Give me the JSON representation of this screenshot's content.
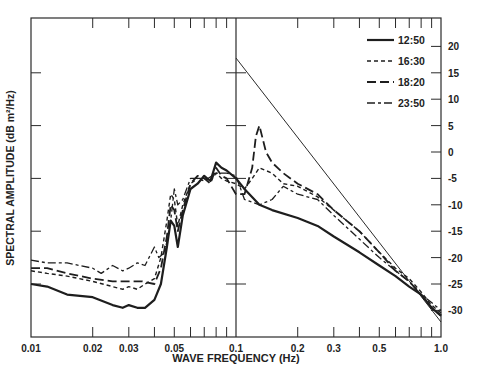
{
  "chart_data": {
    "type": "line",
    "title": "",
    "xlabel": "WAVE FREQUENCY (Hz)",
    "ylabel": "SPECTRAL AMPLITUDE (dB m²/Hz)",
    "xscale": "log",
    "xlim": [
      0.01,
      1.0
    ],
    "ylim": [
      -37,
      25
    ],
    "x_tick_labels": [
      "0.01",
      "0.02",
      "0.03",
      "0.05",
      "0.1",
      "0.2",
      "0.3",
      "0.5",
      "1.0"
    ],
    "x_ticks": [
      0.01,
      0.02,
      0.03,
      0.05,
      0.1,
      0.2,
      0.3,
      0.5,
      1.0
    ],
    "y_tick_labels": [
      "20",
      "15",
      "10",
      "5",
      "0",
      "-5",
      "-10",
      "-15",
      "-20",
      "-25",
      "-30"
    ],
    "y_ticks": [
      20,
      15,
      10,
      5,
      0,
      -5,
      -10,
      -15,
      -20,
      -25,
      -30
    ],
    "y_axis_side": "right",
    "grid": false,
    "legend_position": "upper right",
    "legend": [
      {
        "label": "12:50",
        "style": "solid"
      },
      {
        "label": "16:30",
        "style": "short-dash"
      },
      {
        "label": "18:20",
        "style": "long-dash"
      },
      {
        "label": "23:50",
        "style": "dash-dot"
      }
    ],
    "reference_line": {
      "style": "thin solid",
      "points": [
        [
          0.1,
          17.8
        ],
        [
          1.0,
          -32.2
        ]
      ]
    },
    "series": [
      {
        "name": "12:50",
        "style": "solid",
        "x": [
          0.01,
          0.012,
          0.015,
          0.02,
          0.025,
          0.028,
          0.03,
          0.033,
          0.036,
          0.04,
          0.043,
          0.046,
          0.048,
          0.05,
          0.052,
          0.055,
          0.06,
          0.065,
          0.07,
          0.075,
          0.08,
          0.085,
          0.09,
          0.1,
          0.11,
          0.13,
          0.15,
          0.2,
          0.25,
          0.3,
          0.4,
          0.5,
          0.6,
          0.7,
          0.8,
          0.9,
          1.0
        ],
        "y": [
          -25,
          -25.5,
          -27,
          -27.5,
          -29,
          -29.5,
          -29,
          -29.5,
          -29.5,
          -28,
          -25,
          -18,
          -13,
          -14,
          -18,
          -12,
          -7,
          -6,
          -4.5,
          -5.5,
          -2,
          -3,
          -3.5,
          -5,
          -7,
          -10,
          -11,
          -12.5,
          -14,
          -16,
          -19,
          -21.5,
          -23.5,
          -25.5,
          -27,
          -29.5,
          -31
        ]
      },
      {
        "name": "16:30",
        "style": "short-dash",
        "x": [
          0.01,
          0.012,
          0.015,
          0.02,
          0.025,
          0.028,
          0.03,
          0.033,
          0.036,
          0.04,
          0.043,
          0.046,
          0.048,
          0.05,
          0.052,
          0.055,
          0.06,
          0.065,
          0.07,
          0.075,
          0.08,
          0.085,
          0.09,
          0.1,
          0.11,
          0.12,
          0.13,
          0.15,
          0.17,
          0.2,
          0.25,
          0.3,
          0.4,
          0.5,
          0.6,
          0.7,
          0.8,
          0.9,
          1.0
        ],
        "y": [
          -22.5,
          -23,
          -23.5,
          -24.5,
          -25.5,
          -26,
          -25.5,
          -26,
          -25,
          -24,
          -20,
          -13,
          -8,
          -9,
          -14,
          -10,
          -6,
          -5,
          -5,
          -5.5,
          -4,
          -5,
          -5.5,
          -6,
          -7,
          -5,
          -3,
          -4,
          -6,
          -6.5,
          -8.5,
          -11,
          -15,
          -19,
          -22,
          -24,
          -26.5,
          -29,
          -30.5
        ]
      },
      {
        "name": "18:20",
        "style": "long-dash",
        "x": [
          0.01,
          0.012,
          0.015,
          0.02,
          0.025,
          0.03,
          0.035,
          0.04,
          0.043,
          0.046,
          0.048,
          0.05,
          0.052,
          0.055,
          0.06,
          0.065,
          0.07,
          0.075,
          0.08,
          0.085,
          0.09,
          0.1,
          0.11,
          0.12,
          0.125,
          0.13,
          0.14,
          0.15,
          0.17,
          0.2,
          0.25,
          0.3,
          0.4,
          0.5,
          0.6,
          0.7,
          0.8,
          0.9,
          1.0
        ],
        "y": [
          -22,
          -22,
          -23,
          -24,
          -24.5,
          -24.5,
          -24.5,
          -25,
          -22,
          -16,
          -10,
          -11,
          -15,
          -11,
          -6,
          -4.5,
          -5,
          -6,
          -3,
          -4.5,
          -5,
          -8,
          -8,
          -3,
          3,
          5,
          0,
          -2,
          -4,
          -6,
          -8,
          -11,
          -15,
          -19,
          -22.5,
          -24.5,
          -27,
          -29.5,
          -31
        ]
      },
      {
        "name": "23:50",
        "style": "dash-dot",
        "x": [
          0.01,
          0.012,
          0.015,
          0.02,
          0.022,
          0.025,
          0.028,
          0.03,
          0.033,
          0.036,
          0.04,
          0.042,
          0.045,
          0.048,
          0.05,
          0.052,
          0.055,
          0.06,
          0.065,
          0.07,
          0.08,
          0.09,
          0.1,
          0.11,
          0.13,
          0.15,
          0.17,
          0.2,
          0.25,
          0.3,
          0.4,
          0.5,
          0.6,
          0.7,
          0.8,
          0.9,
          1.0
        ],
        "y": [
          -20.5,
          -21,
          -21,
          -22,
          -23,
          -21.5,
          -22.5,
          -22,
          -21,
          -21.5,
          -18,
          -20,
          -19,
          -13,
          -7,
          -10,
          -9,
          -5,
          -5,
          -5.5,
          -4,
          -4,
          -4.5,
          -9,
          -10,
          -9,
          -6.5,
          -8,
          -9,
          -12,
          -16.5,
          -20,
          -22.5,
          -24.5,
          -27,
          -28.5,
          -30
        ]
      }
    ]
  }
}
